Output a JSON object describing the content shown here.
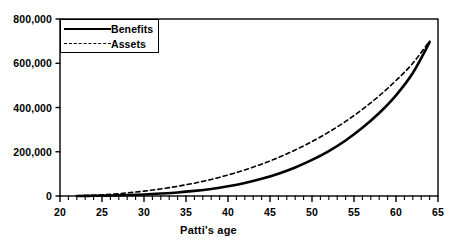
{
  "chart_data": {
    "type": "line",
    "title": "",
    "subtitle": "",
    "xlabel": "Patti's age",
    "ylabel": "",
    "xlim": [
      20,
      65
    ],
    "ylim": [
      0,
      800000
    ],
    "grid": false,
    "legend_position": "top-left",
    "x_major_ticks": [
      20,
      25,
      30,
      35,
      40,
      45,
      50,
      55,
      60,
      65
    ],
    "x_tick_labels": [
      "20",
      "25",
      "30",
      "35",
      "40",
      "45",
      "50",
      "55",
      "60",
      "65"
    ],
    "x_minor_tick_interval": 1,
    "y_major_ticks": [
      0,
      200000,
      400000,
      600000,
      800000
    ],
    "y_tick_labels": [
      "0",
      "200,000",
      "400,000",
      "600,000",
      "800,000"
    ],
    "x": [
      22,
      24,
      26,
      28,
      30,
      32,
      34,
      36,
      38,
      40,
      42,
      44,
      46,
      48,
      50,
      52,
      54,
      56,
      58,
      60,
      62,
      64
    ],
    "series": [
      {
        "name": "Benefits",
        "style": "solid",
        "color": "#000000",
        "width": 2.6,
        "values": [
          0,
          1000,
          2500,
          4500,
          7000,
          11000,
          16000,
          23000,
          32000,
          44000,
          59000,
          78000,
          101000,
          129000,
          163000,
          203000,
          251000,
          308000,
          375000,
          455000,
          556000,
          695000
        ]
      },
      {
        "name": "Assets",
        "style": "dashed",
        "color": "#000000",
        "width": 1.6,
        "values": [
          0,
          3500,
          8000,
          14000,
          22000,
          32000,
          44000,
          58000,
          75000,
          95000,
          118000,
          144000,
          174000,
          208000,
          246000,
          289000,
          337000,
          392000,
          453000,
          522000,
          600000,
          700000
        ]
      }
    ],
    "annotations": []
  },
  "legend": {
    "items": [
      {
        "label": "Benefits",
        "style": "solid"
      },
      {
        "label": "Assets",
        "style": "dashed"
      }
    ]
  },
  "axis": {
    "x_title": "Patti's age"
  }
}
